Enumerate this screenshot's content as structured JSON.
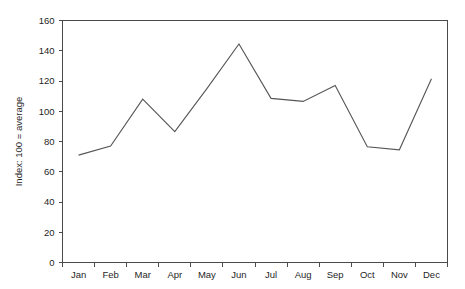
{
  "chart_data": {
    "type": "line",
    "title": "",
    "subtitle": "",
    "xlabel": "",
    "ylabel": "Index: 100 = average",
    "categories": [
      "Jan",
      "Feb",
      "Mar",
      "Apr",
      "May",
      "Jun",
      "Jul",
      "Aug",
      "Sep",
      "Oct",
      "Nov",
      "Dec"
    ],
    "values": [
      71,
      77,
      108,
      86.5,
      115,
      144.5,
      108.5,
      106.5,
      117,
      76.5,
      74.5,
      121.5
    ],
    "series": [
      {
        "name": "Index",
        "values": [
          71,
          77,
          108,
          86.5,
          115,
          144.5,
          108.5,
          106.5,
          117,
          76.5,
          74.5,
          121.5
        ]
      }
    ],
    "ylim": [
      0,
      160
    ],
    "ytick_step": 20,
    "yticks": [
      0,
      20,
      40,
      60,
      80,
      100,
      120,
      140,
      160
    ],
    "ytick_labels": [
      "0",
      "20",
      "40",
      "60",
      "80",
      "100",
      "120",
      "140",
      "160"
    ],
    "xtick_labels": [
      "Jan",
      "Feb",
      "Mar",
      "Apr",
      "May",
      "Jun",
      "Jul",
      "Aug",
      "Sep",
      "Oct",
      "Nov",
      "Dec"
    ],
    "grid": false,
    "legend": false,
    "legend_position": "none",
    "line_color": "#565656",
    "axis_color": "#4a4a4a",
    "background_color": "#ffffff",
    "annotations": []
  }
}
